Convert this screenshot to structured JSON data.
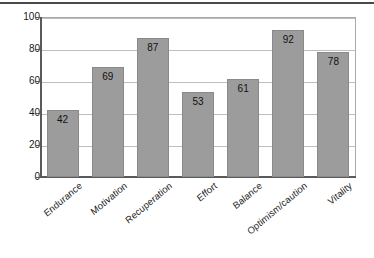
{
  "chart_data": {
    "type": "bar",
    "title": "",
    "subtitle": "",
    "xlabel": "",
    "ylabel": "",
    "categories": [
      "Endurance",
      "Motivation",
      "Recuperation",
      "Effort",
      "Balance",
      "Optimism/caution",
      "Vitality"
    ],
    "values": [
      42,
      69,
      87,
      53,
      61,
      92,
      78
    ],
    "value_labels": [
      "42",
      "69",
      "87",
      "53",
      "61",
      "92",
      "78"
    ],
    "ylim": [
      0,
      100
    ],
    "yticks": [
      0,
      20,
      40,
      60,
      80,
      100
    ],
    "ytick_labels": [
      "0",
      "20",
      "40",
      "60",
      "80",
      "100"
    ],
    "grid": true,
    "grid_axis": "y",
    "legend": false,
    "legend_position": "none",
    "bar_color": "#9c9c9c",
    "bar_edge_color": "#8a8a8a",
    "axis_color": "#5a5a5a",
    "grid_color": "#bdbdbd",
    "plot_border_color": "#a9a9a9",
    "background_color": "#ffffff",
    "value_label_position": "inside-top",
    "xtick_label_rotation": -40
  },
  "decorations": {
    "top_rule_color": "#4a4a4a"
  }
}
